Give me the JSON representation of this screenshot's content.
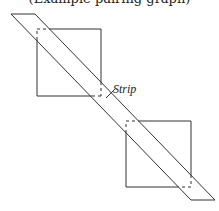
{
  "caption": "(Example pairing graph)",
  "labels": {
    "strip": "Strip"
  },
  "colors": {
    "stroke": "#333333",
    "background": "#ffffff"
  },
  "shapes": {
    "strip": {
      "left_line": [
        [
          11,
          14
        ],
        [
          191,
          200
        ]
      ],
      "right_line": [
        [
          35,
          14
        ],
        [
          215,
          200
        ]
      ]
    },
    "square_top": {
      "x": 37,
      "y": 29,
      "w": 64,
      "h": 67
    },
    "square_bottom": {
      "x": 126,
      "y": 121,
      "w": 65,
      "h": 66
    }
  }
}
